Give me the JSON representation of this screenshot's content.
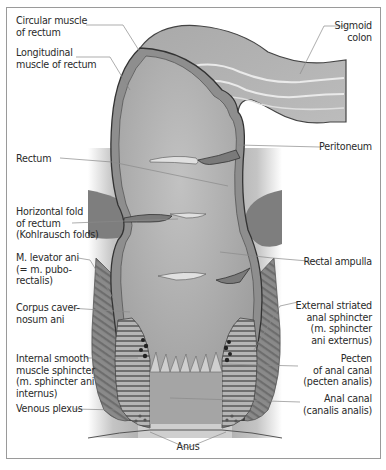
{
  "figure": {
    "colors": {
      "frame": "#9a9a9a",
      "background_panel": "#c9c9c9",
      "wall": "#8d8d8d",
      "lumen": "#a9a9a9",
      "muscle": "#7b7b7b",
      "leader_line": "#8a8a8a",
      "text": "#2a2a2a"
    }
  },
  "labels_left": [
    {
      "id": "circular-muscle",
      "text": "Circular muscle\nof rectum"
    },
    {
      "id": "longitudinal-muscle",
      "text": "Longitudinal\nmuscle of rectum"
    },
    {
      "id": "rectum",
      "text": "Rectum"
    },
    {
      "id": "horizontal-fold",
      "text": "Horizontal fold\nof rectum\n(Kohlrausch folds)"
    },
    {
      "id": "levator-ani",
      "text": "M. levator ani\n(= m. pubo-\nrectalis)"
    },
    {
      "id": "corpus-cavernosum",
      "text": "Corpus caver-\nnosum ani"
    },
    {
      "id": "internal-sphincter",
      "text": "Internal smooth\nmuscle sphincter\n(m. sphincter ani\ninternus)"
    },
    {
      "id": "venous-plexus",
      "text": "Venous plexus"
    }
  ],
  "labels_right": [
    {
      "id": "sigmoid-colon",
      "text": "Sigmoid\ncolon"
    },
    {
      "id": "peritoneum",
      "text": "Peritoneum"
    },
    {
      "id": "rectal-ampulla",
      "text": "Rectal ampulla"
    },
    {
      "id": "external-sphincter",
      "text": "External striated\nanal sphincter\n(m. sphincter\nani externus)"
    },
    {
      "id": "pecten",
      "text": "Pecten\nof anal canal\n(pecten analis)"
    },
    {
      "id": "anal-canal",
      "text": "Anal canal\n(canalis analis)"
    }
  ],
  "labels_bottom": [
    {
      "id": "anus",
      "text": "Anus"
    }
  ]
}
